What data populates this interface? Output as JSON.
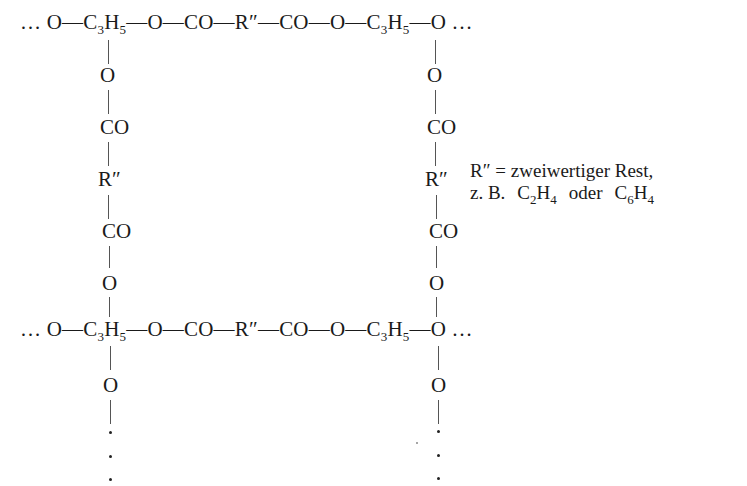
{
  "diagram": {
    "type": "polymer-network-structure",
    "chain_top": {
      "lead": "… ",
      "parts": [
        "O",
        "—",
        "C",
        "3",
        "H",
        "5",
        "—O—CO—R″—CO—O—",
        "C",
        "3",
        "H",
        "5",
        "—O",
        " …"
      ]
    },
    "chain_bottom": {
      "lead": "… ",
      "parts": [
        "O",
        "—",
        "C",
        "3",
        "H",
        "5",
        "—O—CO—R″—CO—O—",
        "C",
        "3",
        "H",
        "5",
        "—O",
        " …"
      ]
    },
    "crosslink_left": [
      "O",
      "CO",
      "R″",
      "CO",
      "O"
    ],
    "crosslink_right": [
      "O",
      "CO",
      "R″",
      "CO",
      "O"
    ],
    "pendant_left": "O",
    "pendant_right": "O",
    "legend": {
      "line1": "R″ = zweiwertiger Rest,",
      "line2_prefix": "z. B.",
      "example1_c": "C",
      "example1_c_sub": "2",
      "example1_h": "H",
      "example1_h_sub": "4",
      "conj": "oder",
      "example2_c": "C",
      "example2_c_sub": "6",
      "example2_h": "H",
      "example2_h_sub": "4"
    }
  }
}
